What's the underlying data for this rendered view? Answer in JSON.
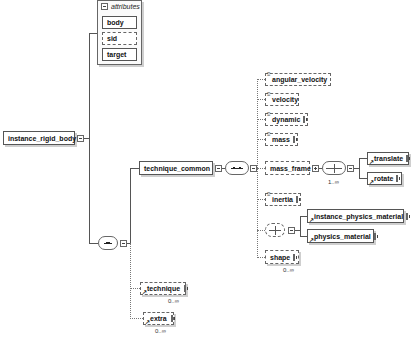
{
  "root": {
    "label": "instance_rigid_body"
  },
  "attributes": {
    "header": "attributes",
    "items": [
      {
        "label": "body",
        "required": true
      },
      {
        "label": "sid",
        "required": false
      },
      {
        "label": "target",
        "required": true
      }
    ]
  },
  "technique_common": {
    "label": "technique_common",
    "children": [
      {
        "label": "angular_velocity",
        "optional": true,
        "expandable": false
      },
      {
        "label": "velocity",
        "optional": true,
        "expandable": false
      },
      {
        "label": "dynamic",
        "optional": true,
        "expandable": true
      },
      {
        "label": "mass",
        "optional": true,
        "expandable": true
      },
      {
        "label": "mass_frame",
        "optional": true,
        "expandable": true
      },
      {
        "label": "inertia",
        "optional": true,
        "expandable": true
      },
      {
        "label": "shape",
        "optional": true,
        "expandable": true,
        "cardinality": "0..∞"
      }
    ],
    "mass_frame_choice": {
      "cardinality": "1..∞",
      "items": [
        {
          "label": "translate"
        },
        {
          "label": "rotate"
        }
      ]
    },
    "material_choice": {
      "items": [
        {
          "label": "instance_physics_material"
        },
        {
          "label": "physics_material"
        }
      ]
    }
  },
  "sequence_children": [
    {
      "label": "technique",
      "cardinality": "0..∞"
    },
    {
      "label": "extra",
      "cardinality": "0..∞"
    }
  ]
}
